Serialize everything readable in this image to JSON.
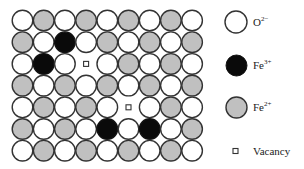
{
  "figure": {
    "type": "crystal-lattice-defect-diagram",
    "grid": {
      "rows": 7,
      "cols": 9,
      "origin_x": 22.5,
      "origin_y": 20.5,
      "pitch_x": 21.2,
      "pitch_y": 21.7,
      "radius": 10.3,
      "cells": [
        [
          "O",
          "G",
          "O",
          "G",
          "O",
          "G",
          "O",
          "G",
          "O"
        ],
        [
          "G",
          "O",
          "B",
          "O",
          "G",
          "O",
          "G",
          "O",
          "G"
        ],
        [
          "O",
          "B",
          "O",
          "V",
          "O",
          "G",
          "O",
          "G",
          "O"
        ],
        [
          "G",
          "O",
          "G",
          "O",
          "G",
          "O",
          "G",
          "O",
          "G"
        ],
        [
          "O",
          "G",
          "O",
          "G",
          "O",
          "V",
          "O",
          "G",
          "O"
        ],
        [
          "G",
          "O",
          "G",
          "O",
          "B",
          "O",
          "B",
          "O",
          "G"
        ],
        [
          "O",
          "G",
          "O",
          "G",
          "O",
          "G",
          "O",
          "G",
          "O"
        ]
      ]
    },
    "colors": {
      "O": "#ffffff",
      "G": "#c0c0c0",
      "B": "#0a0a0a",
      "stroke": "#333333"
    },
    "legend": [
      {
        "key": "O",
        "symbol": "open-circle",
        "base": "O",
        "sup": "2−",
        "cy": 22
      },
      {
        "key": "B",
        "symbol": "black-circle",
        "base": "Fe",
        "sup": "3+",
        "cy": 65
      },
      {
        "key": "G",
        "symbol": "gray-circle",
        "base": "Fe",
        "sup": "2+",
        "cy": 107
      },
      {
        "key": "V",
        "symbol": "small-square",
        "base": "Vacancy",
        "sup": "",
        "cy": 151
      }
    ]
  }
}
